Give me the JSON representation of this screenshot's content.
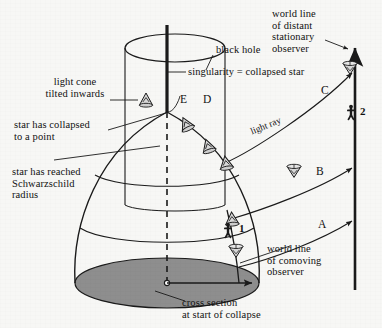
{
  "figure": {
    "background_color": "#f7f7f5",
    "ink_color": "#1a1a1a",
    "shade_color": "#8e8e8e",
    "width": 382,
    "height": 328
  },
  "labels": {
    "light_cone_tilted": "light cone\ntilted inwards",
    "star_collapsed_point": "star has collapsed\nto a point",
    "star_schwarzschild": "star has reached\nSchwarzschild\nradius",
    "black_hole": "black hole",
    "singularity": "singularity = collapsed star",
    "world_line_distant": "world line\nof distant\nstationary\nobserver",
    "world_line_comoving": "world line\nof comoving\nobserver",
    "cross_section": "cross section\nat start of collapse",
    "light_ray": "light ray"
  },
  "markers": {
    "ray_A": "A",
    "ray_B": "B",
    "ray_C": "C",
    "event_D": "D",
    "event_E": "E",
    "observer_1": "1",
    "observer_2": "2"
  },
  "elements": {
    "singularity_line": "vertical-thick-line",
    "horizon_cylinder": "black-hole-event-horizon",
    "star_surface": "collapsing-star-dome",
    "initial_cross_section": "shaded-ellipse",
    "distant_observer_worldline": "vertical-arrow-line",
    "comoving_observer_worldline": "curve-to-singularity",
    "light_cones_count": 9,
    "light_rays_count": 3
  }
}
